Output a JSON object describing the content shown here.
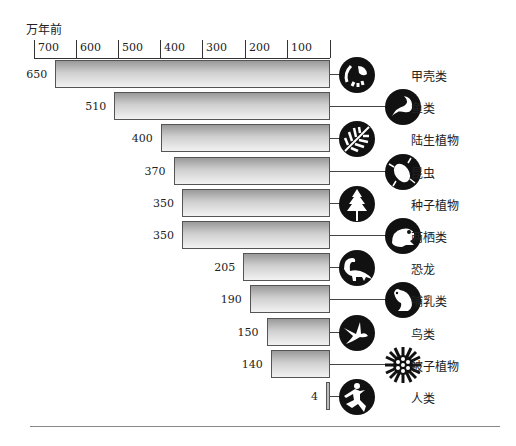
{
  "chart_data": {
    "type": "bar",
    "orientation": "horizontal",
    "title": "",
    "unit_label": "万年前",
    "xlabel": "万年前",
    "ylabel": "",
    "axis_ticks": [
      "700",
      "600",
      "500",
      "400",
      "300",
      "200",
      "100"
    ],
    "xlim": [
      700,
      0
    ],
    "grid": false,
    "categories": [
      "甲壳类",
      "鱼类",
      "陆生植物",
      "昆虫",
      "种子植物",
      "两栖类",
      "恐龙",
      "哺乳类",
      "鸟类",
      "被子植物",
      "人类"
    ],
    "values": [
      650,
      510,
      400,
      370,
      350,
      350,
      205,
      190,
      150,
      140,
      4
    ],
    "value_labels": [
      "650",
      "510",
      "400",
      "370",
      "350",
      "350",
      "205",
      "190",
      "150",
      "140",
      "4"
    ],
    "icons": [
      "crab-icon",
      "fish-icon",
      "fern-leaf-icon",
      "insect-icon",
      "pine-tree-icon",
      "frog-icon",
      "dinosaur-icon",
      "rodent-icon",
      "bird-icon",
      "flower-icon",
      "human-icon"
    ]
  }
}
